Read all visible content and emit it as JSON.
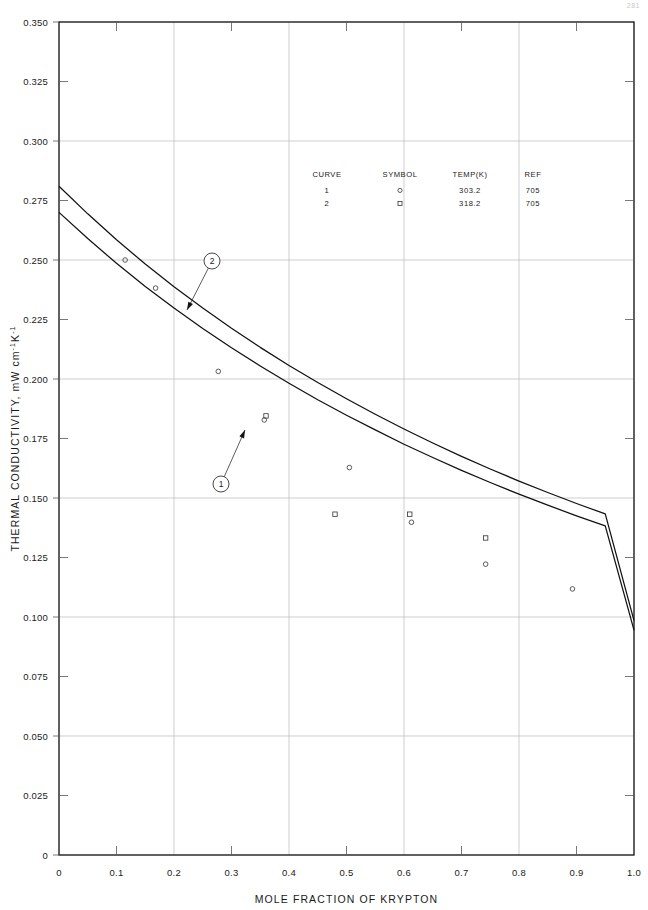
{
  "page": {
    "number": "281"
  },
  "chart_data": {
    "type": "line",
    "title": "",
    "xlabel": "MOLE FRACTION OF KRYPTON",
    "ylabel": "THERMAL CONDUCTIVITY, mW cm⁻¹K⁻¹",
    "ylabel_parts": {
      "main": "THERMAL CONDUCTIVITY, mW",
      "unit1": "cm",
      "sup1": "-1",
      "unit2": "K",
      "sup2": "-1"
    },
    "xlim": [
      0,
      1.0
    ],
    "ylim": [
      0,
      0.35
    ],
    "grid": true,
    "grid_x_major": [
      0,
      0.2,
      0.4,
      0.6,
      0.8,
      1.0
    ],
    "grid_y_major": [
      0,
      0.05,
      0.1,
      0.15,
      0.2,
      0.25,
      0.3,
      0.35
    ],
    "legend_position": "inside-top-center",
    "xticks": [
      0,
      0.1,
      0.2,
      0.3,
      0.4,
      0.5,
      0.6,
      0.7,
      0.8,
      0.9,
      1.0
    ],
    "xtick_labels": [
      "0",
      "0.1",
      "0.2",
      "0.3",
      "0.4",
      "0.5",
      "0.6",
      "0.7",
      "0.8",
      "0.9",
      "1.0"
    ],
    "yticks": [
      0,
      0.025,
      0.05,
      0.075,
      0.1,
      0.125,
      0.15,
      0.175,
      0.2,
      0.225,
      0.25,
      0.275,
      0.3,
      0.325,
      0.35
    ],
    "ytick_labels": [
      "0",
      "0.025",
      "0.050",
      "0.075",
      "0.100",
      "0.125",
      "0.150",
      "0.175",
      "0.200",
      "0.225",
      "0.250",
      "0.275",
      "0.300",
      "0.325",
      "0.350"
    ],
    "series": [
      {
        "name": "2",
        "label": "2",
        "temp": "318.2",
        "ref": "705",
        "symbol": "square",
        "x": [
          0.0,
          0.05,
          0.1,
          0.15,
          0.2,
          0.25,
          0.3,
          0.35,
          0.4,
          0.45,
          0.5,
          0.55,
          0.6,
          0.65,
          0.7,
          0.75,
          0.8,
          0.85,
          0.9,
          0.95,
          1.0
        ],
        "values": [
          0.281,
          0.2694,
          0.2585,
          0.2483,
          0.2388,
          0.2298,
          0.2213,
          0.2133,
          0.2057,
          0.1985,
          0.1917,
          0.1852,
          0.179,
          0.1731,
          0.1675,
          0.1622,
          0.1571,
          0.1523,
          0.1477,
          0.1433,
          0.0985
        ]
      },
      {
        "name": "1",
        "label": "1",
        "temp": "303.2",
        "ref": "705",
        "symbol": "circle",
        "x": [
          0.0,
          0.05,
          0.1,
          0.15,
          0.2,
          0.25,
          0.3,
          0.35,
          0.4,
          0.45,
          0.5,
          0.55,
          0.6,
          0.65,
          0.7,
          0.75,
          0.8,
          0.85,
          0.9,
          0.95,
          1.0
        ],
        "values": [
          0.27,
          0.259,
          0.2486,
          0.2389,
          0.2298,
          0.2212,
          0.2131,
          0.2055,
          0.1982,
          0.1913,
          0.1848,
          0.1786,
          0.1726,
          0.167,
          0.1616,
          0.1565,
          0.1516,
          0.147,
          0.1425,
          0.1383,
          0.0945
        ]
      }
    ],
    "points": [
      {
        "series": "1",
        "symbol": "circle",
        "x": 0.115,
        "y": 0.25
      },
      {
        "series": "1",
        "symbol": "circle",
        "x": 0.168,
        "y": 0.2382
      },
      {
        "series": "1",
        "symbol": "circle",
        "x": 0.277,
        "y": 0.2032
      },
      {
        "series": "2",
        "symbol": "square",
        "x": 0.36,
        "y": 0.1845
      },
      {
        "series": "1",
        "symbol": "circle",
        "x": 0.357,
        "y": 0.1828
      },
      {
        "series": "2",
        "symbol": "square",
        "x": 0.48,
        "y": 0.1432
      },
      {
        "series": "1",
        "symbol": "circle",
        "x": 0.505,
        "y": 0.1628
      },
      {
        "series": "2",
        "symbol": "square",
        "x": 0.61,
        "y": 0.1432
      },
      {
        "series": "1",
        "symbol": "circle",
        "x": 0.613,
        "y": 0.1398
      },
      {
        "series": "2",
        "symbol": "square",
        "x": 0.742,
        "y": 0.1332
      },
      {
        "series": "1",
        "symbol": "circle",
        "x": 0.742,
        "y": 0.1222
      },
      {
        "series": "1",
        "symbol": "circle",
        "x": 0.893,
        "y": 0.1118
      }
    ],
    "annotations": [
      {
        "label": "2",
        "circle_x": 212,
        "circle_y": 261,
        "leader_to_x": 187,
        "leader_to_y": 310
      },
      {
        "label": "1",
        "circle_x": 221,
        "circle_y": 484,
        "leader_to_x": 245,
        "leader_to_y": 430
      }
    ]
  },
  "legend": {
    "headers": [
      "CURVE",
      "SYMBOL",
      "TEMP(K)",
      "REF"
    ],
    "rows": [
      {
        "curve": "1",
        "symbol": "circle",
        "temp": "303.2",
        "ref": "705"
      },
      {
        "curve": "2",
        "symbol": "square",
        "temp": "318.2",
        "ref": "705"
      }
    ]
  }
}
